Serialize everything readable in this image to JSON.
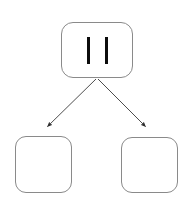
{
  "diagram": {
    "background_color": "#ffffff",
    "node_border_color": "#8a8a8a",
    "node_fill_color": "#ffffff",
    "edge_color": "#3a3a3a",
    "icon_color": "#0d0d0d",
    "nodes": [
      {
        "id": "root",
        "label": "",
        "icon": "pause-icon",
        "role": "parent",
        "x": 61,
        "y": 22,
        "width": 72,
        "height": 56
      },
      {
        "id": "child-left",
        "label": "",
        "icon": "",
        "role": "child",
        "x": 15,
        "y": 136,
        "width": 57,
        "height": 57
      },
      {
        "id": "child-right",
        "label": "",
        "icon": "",
        "role": "child",
        "x": 121,
        "y": 137,
        "width": 57,
        "height": 56
      }
    ],
    "edges": [
      {
        "id": "edge-root-left",
        "from": "root",
        "to": "child-left",
        "label": "",
        "arrowhead": "filled-triangle",
        "x1": 96,
        "y1": 79,
        "x2": 45,
        "y2": 130
      },
      {
        "id": "edge-root-right",
        "from": "root",
        "to": "child-right",
        "label": "",
        "arrowhead": "filled-triangle",
        "x1": 98,
        "y1": 79,
        "x2": 148,
        "y2": 130
      }
    ]
  }
}
